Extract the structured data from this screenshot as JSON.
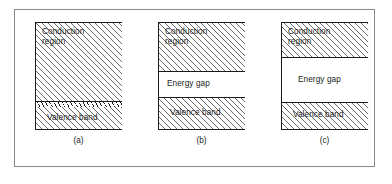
{
  "figure": {
    "title": "",
    "border_color": "#8a8a8a",
    "line_color": "#1a1a1a",
    "hatch_color": "#6b6b6b"
  },
  "diagrams": [
    {
      "caption": "(a)",
      "type": "conductor",
      "bands": [
        {
          "name": "conduction",
          "label": "Conduction\nregion",
          "fill": "hatched"
        },
        {
          "name": "interface",
          "label": "",
          "fill": "ticks"
        },
        {
          "name": "valence",
          "label": "Valence  band",
          "fill": "hatched"
        }
      ]
    },
    {
      "caption": "(b)",
      "type": "semiconductor",
      "bands": [
        {
          "name": "conduction",
          "label": "Conduction\nregion",
          "fill": "hatched"
        },
        {
          "name": "gap",
          "label": "Energy gap",
          "fill": "plain"
        },
        {
          "name": "valence",
          "label": "Valence  band",
          "fill": "hatched"
        }
      ]
    },
    {
      "caption": "(c)",
      "type": "insulator",
      "bands": [
        {
          "name": "conduction",
          "label": "Conduction\nregion",
          "fill": "hatched"
        },
        {
          "name": "gap",
          "label": "Energy  gap",
          "fill": "plain"
        },
        {
          "name": "valence",
          "label": "Valence  band",
          "fill": "hatched"
        }
      ]
    }
  ]
}
